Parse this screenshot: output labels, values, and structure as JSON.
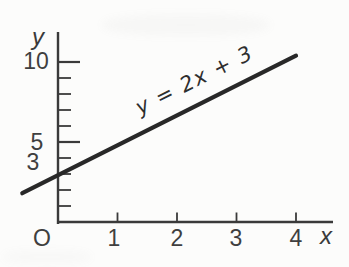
{
  "figure": {
    "background": "#fcfcfb",
    "axis_color": "#3a3a3a",
    "line_color": "#282828",
    "label_color": "#3f3f3f"
  },
  "labels": {
    "y_axis_title": "y",
    "x_axis_title": "x",
    "origin": "O",
    "equation": "y = 2x + 3",
    "y_ticks": {
      "v10": "10",
      "v5": "5",
      "v3": "3"
    },
    "x_ticks": {
      "v1": "1",
      "v2": "2",
      "v3": "3",
      "v4": "4"
    }
  },
  "chart_data": {
    "type": "line",
    "title": "",
    "equation_label": "y = 2x + 3",
    "slope": 2,
    "intercept": 3,
    "points_as_drawn": [
      {
        "x": -0.6,
        "y": 1.8
      },
      {
        "x": 4.0,
        "y": 10.4
      }
    ],
    "xlabel": "x",
    "ylabel": "y",
    "xlim": [
      -0.65,
      4.7
    ],
    "ylim": [
      0,
      12.2
    ],
    "x_ticks": [
      1,
      2,
      3,
      4
    ],
    "x_tick_labels": [
      "1",
      "2",
      "3",
      "4"
    ],
    "y_ticks_minor": [
      1,
      2,
      3,
      4,
      6,
      7,
      8,
      9
    ],
    "y_ticks_major": [
      5,
      10
    ],
    "y_tick_labels": [
      "3",
      "5",
      "10"
    ],
    "origin_label": "O",
    "grid": false,
    "legend": null
  }
}
